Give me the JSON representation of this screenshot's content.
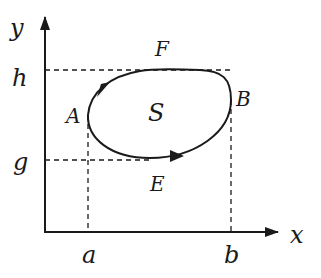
{
  "diagram": {
    "axes": {
      "x_label": "x",
      "y_label": "y"
    },
    "ticks": {
      "x": [
        {
          "label": "a"
        },
        {
          "label": "b"
        }
      ],
      "y": [
        {
          "label": "h"
        },
        {
          "label": "g"
        }
      ]
    },
    "curve": {
      "region_label": "S",
      "points": [
        {
          "label": "A",
          "description": "leftmost point, x = a"
        },
        {
          "label": "B",
          "description": "rightmost point, x = b"
        },
        {
          "label": "F",
          "description": "top point, y = h"
        },
        {
          "label": "E",
          "description": "bottom point, y = g"
        }
      ],
      "orientation": "counterclockwise"
    },
    "colors": {
      "stroke": "#1a1a1a",
      "background": "#ffffff"
    }
  }
}
